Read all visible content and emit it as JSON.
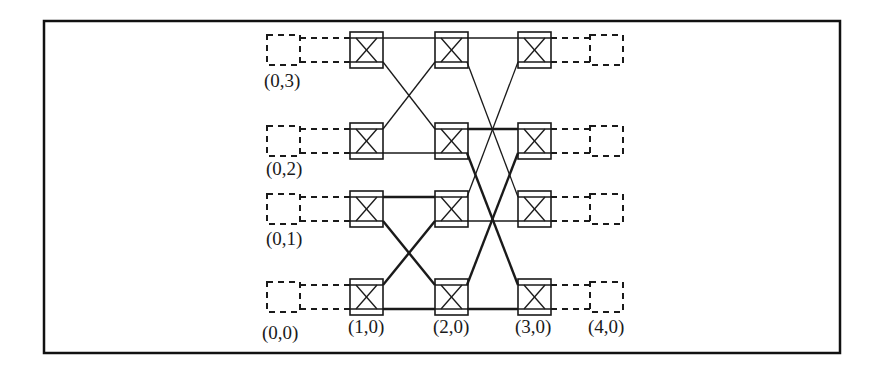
{
  "diagram": {
    "type": "butterfly-network",
    "frame": {
      "x": 44,
      "y": 21,
      "w": 796,
      "h": 332
    },
    "colors": {
      "ink": "#1a1a1a",
      "background": "#ffffff"
    },
    "columns_x": [
      283,
      366,
      451,
      534,
      606
    ],
    "rows_y": {
      "3": 50,
      "2": 141,
      "1": 209,
      "0": 297
    },
    "labels": {
      "n03": "(0,3)",
      "n02": "(0,2)",
      "n01": "(0,1)",
      "n00": "(0,0)",
      "n10": "(1,0)",
      "n20": "(2,0)",
      "n30": "(3,0)",
      "n40": "(4,0)"
    },
    "switch_icon": "crossbar-switch-icon",
    "endpoint_icon": "dashed-node-icon"
  }
}
